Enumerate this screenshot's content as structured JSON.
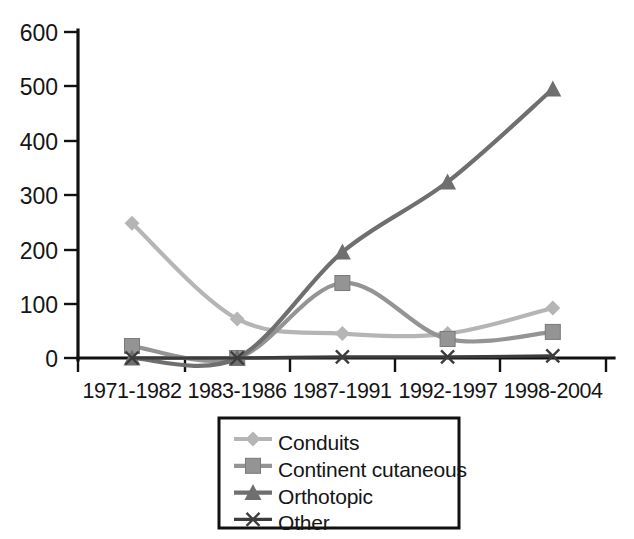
{
  "chart_data": {
    "type": "line",
    "title": "",
    "subtitle": "",
    "xlabel": "",
    "ylabel": "",
    "categories": [
      "1971-1982",
      "1983-1986",
      "1987-1991",
      "1992-1997",
      "1998-2004"
    ],
    "series": [
      {
        "name": "Conduits",
        "color": "#b5b5b5",
        "marker": "diamond",
        "values": [
          248,
          72,
          45,
          45,
          92
        ]
      },
      {
        "name": "Continent cutaneous",
        "color": "#949494",
        "marker": "square",
        "values": [
          22,
          0,
          138,
          35,
          48
        ]
      },
      {
        "name": "Orthotopic",
        "color": "#6f6f6f",
        "marker": "triangle",
        "values": [
          0,
          0,
          195,
          324,
          495
        ]
      },
      {
        "name": "Other",
        "color": "#3c3c3c",
        "marker": "x",
        "values": [
          0,
          0,
          2,
          2,
          4
        ]
      }
    ],
    "yticks": [
      0,
      100,
      200,
      300,
      400,
      500,
      600
    ],
    "ylim": [
      0,
      600
    ],
    "grid": false,
    "smoothing": true,
    "legend_position": "bottom-center",
    "axis_color": "#111111"
  },
  "yaxis": {
    "labels": [
      "600",
      "500",
      "400",
      "300",
      "200",
      "100",
      "0"
    ]
  },
  "xaxis": {
    "labels": [
      "1971-1982",
      "1983-1986",
      "1987-1991",
      "1992-1997",
      "1998-2004"
    ]
  },
  "legend": {
    "entries": [
      {
        "label": "Conduits",
        "marker": "diamond-marker",
        "color": "#b5b5b5"
      },
      {
        "label": "Continent cutaneous",
        "marker": "square-marker",
        "color": "#949494"
      },
      {
        "label": "Orthotopic",
        "marker": "triangle-marker",
        "color": "#6f6f6f"
      },
      {
        "label": "Other",
        "marker": "x-marker",
        "color": "#3c3c3c"
      }
    ]
  }
}
